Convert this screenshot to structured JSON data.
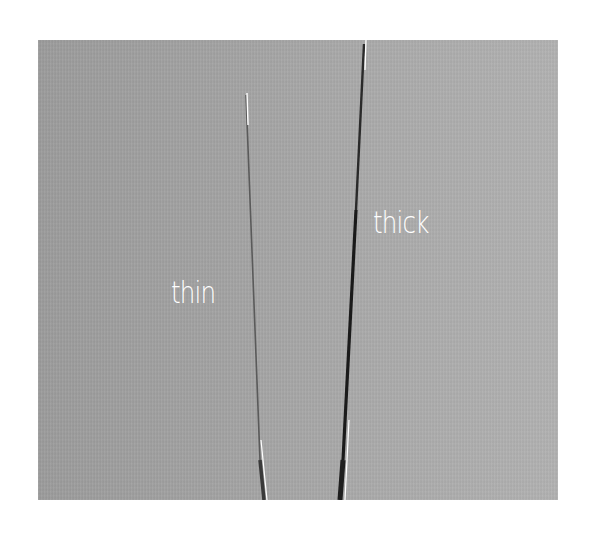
{
  "image": {
    "description": "Photograph of two fibers on gray background comparing thin and thick",
    "background_color": "#a6a6a6",
    "page_background": "#ffffff"
  },
  "labels": {
    "thin": "thin",
    "thick": "thick"
  },
  "fibers": [
    {
      "name": "thin",
      "color": "#555555",
      "highlight": "#ffffff"
    },
    {
      "name": "thick",
      "color": "#1e1e1e",
      "highlight": "#ffffff"
    }
  ]
}
